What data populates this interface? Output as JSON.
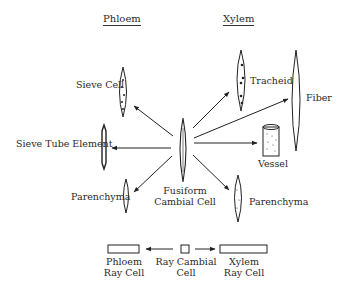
{
  "headers": {
    "phloem": "Phloem",
    "xylem": "Xylem"
  },
  "source_cell": {
    "line1": "Fusiform",
    "line2": "Cambial Cell"
  },
  "phloem_cells": {
    "sieve_cell": "Sieve Cell",
    "sieve_tube_element": "Sieve Tube Element",
    "parenchyma": "Parenchyma"
  },
  "xylem_cells": {
    "tracheid": "Tracheid",
    "fiber": "Fiber",
    "vessel": "Vessel",
    "parenchyma": "Parenchyma"
  },
  "ray": {
    "phloem_ray_cell": {
      "line1": "Phloem",
      "line2": "Ray Cell"
    },
    "ray_cambial_cell": {
      "line1": "Ray Cambial",
      "line2": "Cell"
    },
    "xylem_ray_cell": {
      "line1": "Xylem",
      "line2": "Ray Cell"
    }
  }
}
